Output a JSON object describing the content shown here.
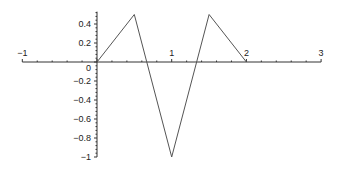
{
  "chart_data": {
    "type": "line",
    "title": "",
    "xlabel": "",
    "ylabel": "",
    "xlim": [
      -1,
      3
    ],
    "ylim": [
      -1,
      0.5
    ],
    "grid": false,
    "legend": null,
    "x_ticks": [
      -1,
      1,
      2,
      3
    ],
    "x_tick_labels": [
      "−1",
      "1",
      "2",
      "3"
    ],
    "y_ticks": [
      0.4,
      0.2,
      0,
      -0.2,
      -0.4,
      -0.6,
      -0.8,
      -1
    ],
    "y_tick_labels": [
      "0.4",
      "0.2",
      "0",
      "−0.2",
      "−0.4",
      "−0.6",
      "−0.8",
      "−1"
    ],
    "series": [
      {
        "name": "f(x)",
        "color": "#555555",
        "x": [
          0,
          0.5,
          1,
          1.5,
          2
        ],
        "y": [
          0,
          0.5,
          -1,
          0.5,
          0
        ]
      }
    ]
  },
  "style": {
    "axis_color": "#333333",
    "line_color": "#555555"
  }
}
